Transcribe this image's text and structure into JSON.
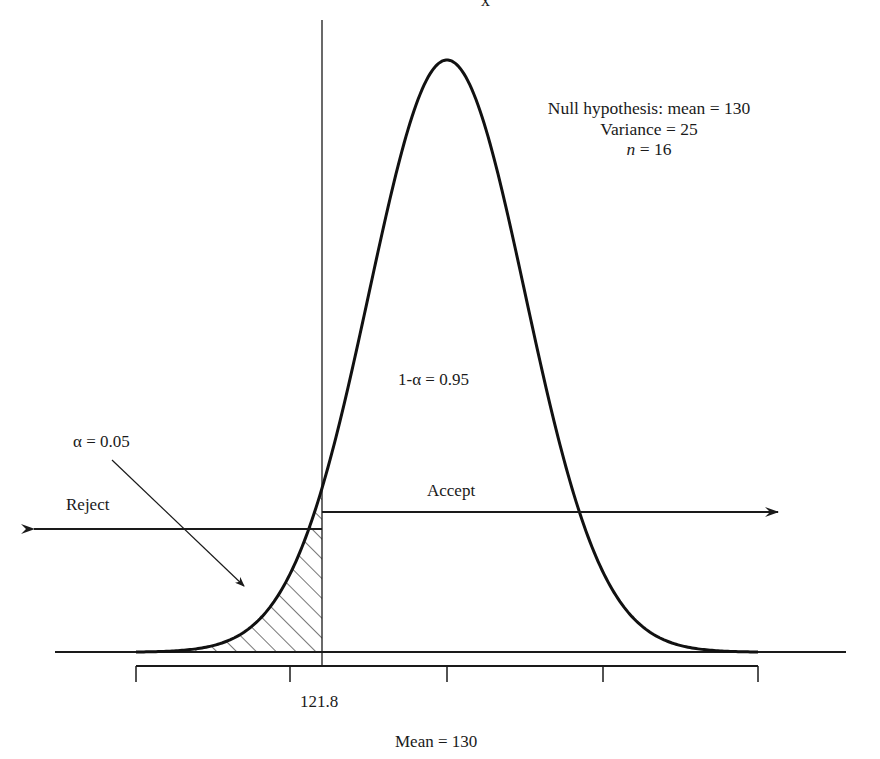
{
  "chart_data": {
    "type": "area",
    "top_label": "x̄",
    "distribution": {
      "family": "normal",
      "mean": 130,
      "variance": 25,
      "n": 16,
      "std_error": 1.25
    },
    "critical_value": 121.8,
    "alpha": 0.05,
    "one_minus_alpha": 0.95,
    "regions": [
      {
        "name": "Reject",
        "side": "left",
        "x_range": [
          null,
          121.8
        ],
        "shaded": true,
        "hatch": "diagonal"
      },
      {
        "name": "Accept",
        "side": "right",
        "x_range": [
          121.8,
          null
        ],
        "shaded": false
      }
    ],
    "annotations": [
      "Null hypothesis: mean = 130",
      "Variance = 25",
      "n = 16",
      "1-α = 0.95",
      "α = 0.05",
      "Reject",
      "Accept",
      "121.8",
      "Mean = 130"
    ],
    "x_ticks": {
      "count": 5,
      "labeled": [
        {
          "value": 121.8,
          "label": "121.8"
        }
      ],
      "center_label": "Mean = 130"
    },
    "grid": false,
    "legend": null
  },
  "labels": {
    "top": "x̄",
    "hyp_line1": "Null hypothesis: mean = 130",
    "hyp_line2": "Variance = 25",
    "hyp_n_var": "n",
    "hyp_n_rest": " = 16",
    "one_minus_alpha": "1-α = 0.95",
    "alpha": "α = 0.05",
    "reject": "Reject",
    "accept": "Accept",
    "critical": "121.8",
    "mean": "Mean = 130"
  },
  "colors": {
    "ink": "#1a1a1a",
    "background": "#ffffff"
  }
}
